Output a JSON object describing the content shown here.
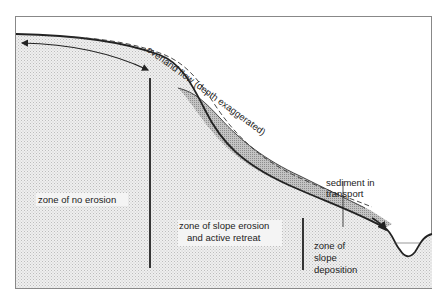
{
  "diagram": {
    "title": "",
    "frame": {
      "x": 15,
      "y": 16,
      "width": 417,
      "height": 273
    },
    "colors": {
      "ground_fill": "#e8e8e8",
      "sediment_fill": "#b5b5b5",
      "line": "#222222",
      "frame": "#888888",
      "background": "#ffffff"
    },
    "labels": {
      "overland_flow": "overland flow (depth exaggerated)",
      "sediment_line1": "sediment in",
      "sediment_line2": "transport",
      "zone_no_erosion": "zone of no erosion",
      "zone_erosion_line1": "zone of slope erosion",
      "zone_erosion_line2": "and active retreat",
      "zone_deposition_line1": "zone of",
      "zone_deposition_line2": "slope",
      "zone_deposition_line3": "deposition"
    }
  }
}
